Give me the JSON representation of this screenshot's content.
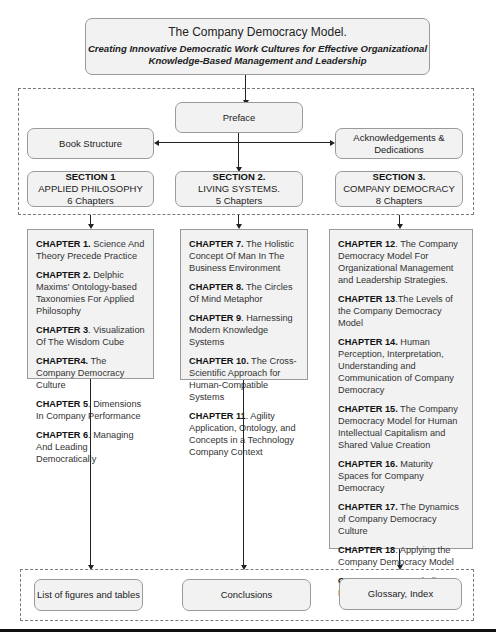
{
  "header": {
    "title": "The Company Democracy Model.",
    "subtitle_line1": "Creating Innovative Democratic Work Cultures for Effective Organizational",
    "subtitle_line2": "Knowledge-Based Management and Leadership"
  },
  "front_matter": {
    "preface": "Preface",
    "book_structure": "Book Structure",
    "acknowledgements_line1": "Acknowledgements &",
    "acknowledgements_line2": "Dedications"
  },
  "sections": [
    {
      "heading": "SECTION 1",
      "name": "APPLIED PHILOSOPHY",
      "count": "6 Chapters",
      "chapters": [
        {
          "num": "CHAPTER 1.",
          "title": " Science And Theory Precede Practice"
        },
        {
          "num": "CHAPTER 2.",
          "title": " Delphic Maxims' Ontology-based Taxonomies For Applied Philosophy"
        },
        {
          "num": "CHAPTER 3",
          "title": ". Visualization Of The Wisdom Cube"
        },
        {
          "num": "CHAPTER4.",
          "title": " The Company Democracy Culture"
        },
        {
          "num": "CHAPTER 5",
          "title": ". Dimensions In Company Performance"
        },
        {
          "num": "CHAPTER 6",
          "title": ". Managing And Leading Democratically"
        }
      ]
    },
    {
      "heading": "SECTION 2.",
      "name": "LIVING SYSTEMS.",
      "count": "5 Chapters",
      "chapters": [
        {
          "num": "CHAPTER 7.",
          "title": " The Holistic Concept Of Man In The Business Environment"
        },
        {
          "num": "CHAPTER 8.",
          "title": " The Circles Of Mind Metaphor"
        },
        {
          "num": "CHAPTER 9",
          "title": ". Harnessing Modern Knowledge Systems"
        },
        {
          "num": "CHAPTER 10.",
          "title": " The Cross-Scientific Approach for Human-Compatible Systems"
        },
        {
          "num": "CHAPTER 11",
          "title": ". Agility Application, Ontology, and Concepts in a Technology Company Context"
        }
      ]
    },
    {
      "heading": "SECTION 3.",
      "name": "COMPANY DEMOCRACY",
      "count": "8 Chapters",
      "chapters": [
        {
          "num": "CHAPTER 12",
          "title": ". The Company Democracy Model For Organizational Management and Leadership Strategies."
        },
        {
          "num": "CHAPTER 13",
          "title": ".The Levels of the Company Democracy Model"
        },
        {
          "num": "CHAPTER 14.",
          "title": " Human Perception, Interpretation, Understanding and Communication of Company Democracy"
        },
        {
          "num": "CHAPTER 15.",
          "title": " The Company Democracy Model for Human Intellectual Capitalism and Shared Value Creation"
        },
        {
          "num": "CHAPTER 16.",
          "title": " Maturity Spaces for Company Democracy"
        },
        {
          "num": "CHAPTER 17.",
          "title": " The Dynamics of Company Democracy Culture"
        },
        {
          "num": "CHAPTER 18",
          "title": ". Applying the Company Democracy Model"
        },
        {
          "num": "CHAPTER 19",
          "title": ". Concluding Remarks"
        }
      ]
    }
  ],
  "back_matter": {
    "figures": "List of figures and tables",
    "conclusions": "Conclusions",
    "glossary": "Glossary, Index"
  }
}
